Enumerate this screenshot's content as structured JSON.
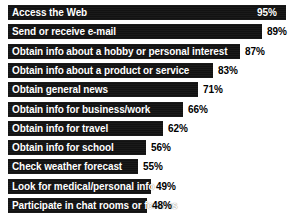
{
  "chart_data": {
    "type": "bar",
    "orientation": "horizontal",
    "title": "",
    "subtitle": "",
    "xlabel": "",
    "ylabel": "",
    "grid": false,
    "legend": null,
    "axis_visible": false,
    "value_suffix": "%",
    "xlim": [
      45,
      100
    ],
    "categories": [
      "Access the Web",
      "Send or receive e-mail",
      "Obtain info about a hobby or personal interest",
      "Obtain info about a product or service",
      "Obtain general news",
      "Obtain info for business/work",
      "Obtain info for travel",
      "Obtain info for school",
      "Check weather forecast",
      "Look for medical/personal info",
      "Participate in chat rooms or forums"
    ],
    "values": [
      95,
      89,
      87,
      83,
      71,
      66,
      62,
      56,
      55,
      49,
      48
    ],
    "value_labels": [
      "95%",
      "89%",
      "87%",
      "83%",
      "71%",
      "66%",
      "62%",
      "56%",
      "55%",
      "49%",
      "48%"
    ],
    "colors": {
      "bar": "#121212",
      "background": "#ffffff",
      "label_on_bar": "#ffffff",
      "value_text": "#000000"
    }
  },
  "rows": [
    {
      "label": "Access the Web",
      "value_label": "95%",
      "bar_width": 278,
      "value_left": 257,
      "value_inside": true
    },
    {
      "label": "Send or receive e-mail",
      "value_label": "89%",
      "bar_width": 254,
      "value_left": 267,
      "value_inside": false
    },
    {
      "label": "Obtain info about a hobby or personal interest",
      "value_label": "87%",
      "bar_width": 232,
      "value_left": 245,
      "value_inside": false
    },
    {
      "label": "Obtain info about a product or service",
      "value_label": "83%",
      "bar_width": 205,
      "value_left": 218,
      "value_inside": false
    },
    {
      "label": "Obtain general news",
      "value_label": "71%",
      "bar_width": 190,
      "value_left": 203,
      "value_inside": false
    },
    {
      "label": "Obtain info for business/work",
      "value_label": "66%",
      "bar_width": 175,
      "value_left": 188,
      "value_inside": false
    },
    {
      "label": "Obtain info for travel",
      "value_label": "62%",
      "bar_width": 155,
      "value_left": 168,
      "value_inside": false
    },
    {
      "label": "Obtain info for school",
      "value_label": "56%",
      "bar_width": 138,
      "value_left": 151,
      "value_inside": false
    },
    {
      "label": "Check weather forecast",
      "value_label": "55%",
      "bar_width": 130,
      "value_left": 143,
      "value_inside": false
    },
    {
      "label": "Look for medical/personal info",
      "value_label": "49%",
      "bar_width": 143,
      "value_left": 156,
      "value_inside": false
    },
    {
      "label": "Participate in chat rooms or forums",
      "value_label": "48%",
      "bar_width": 139,
      "value_left": 152,
      "value_inside": false
    }
  ]
}
